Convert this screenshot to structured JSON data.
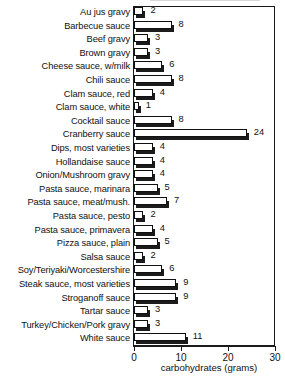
{
  "chart_data": {
    "type": "bar",
    "orientation": "horizontal",
    "title": "",
    "xlabel": "carbohydrates (grams)",
    "ylabel": "",
    "xlim": [
      0,
      30
    ],
    "xticks": [
      0,
      10,
      20,
      30
    ],
    "xtick_labels": [
      "0",
      "10",
      "20",
      "30"
    ],
    "grid": false,
    "legend": null,
    "value_labels": true,
    "categories": [
      "Au jus gravy",
      "Barbecue sauce",
      "Beef gravy",
      "Brown gravy",
      "Cheese sauce, w/milk",
      "Chili sauce",
      "Clam sauce, red",
      "Clam sauce, white",
      "Cocktail sauce",
      "Cranberry sauce",
      "Dips, most varieties",
      "Hollandaise sauce",
      "Onion/Mushroom gravy",
      "Pasta sauce, marinara",
      "Pasta sauce, meat/mush.",
      "Pasta sauce, pesto",
      "Pasta sauce, primavera",
      "Pizza sauce, plain",
      "Salsa sauce",
      "Soy/Teriyaki/Worcestershire",
      "Steak sauce, most varieties",
      "Stroganoff sauce",
      "Tartar sauce",
      "Turkey/Chicken/Pork gravy",
      "White sauce"
    ],
    "values": [
      2,
      8,
      3,
      3,
      6,
      8,
      4,
      1,
      8,
      24,
      4,
      4,
      4,
      5,
      7,
      2,
      4,
      5,
      2,
      6,
      9,
      9,
      3,
      3,
      11
    ],
    "value_label_texts": [
      "2",
      "8",
      "3",
      "3",
      "6",
      "8",
      "4",
      "1",
      "8",
      "24",
      "4",
      "4",
      "4",
      "5",
      "7",
      "2",
      "4",
      "5",
      "2",
      "6",
      "9",
      "9",
      "3",
      "3",
      "11"
    ],
    "colors": {
      "bar_face": "#ffffff",
      "bar_outline": "#101010",
      "bar_shadow": "#1b1b1b",
      "axis": "#1a1a1a",
      "text": "#111111",
      "background": "#ffffff"
    }
  }
}
